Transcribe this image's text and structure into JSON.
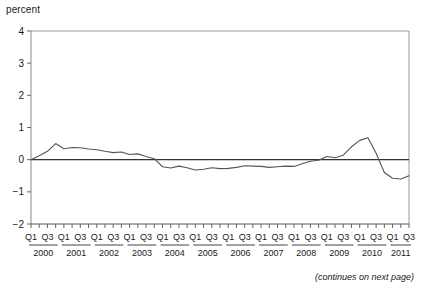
{
  "figure": {
    "caption": "(continues on next page)"
  },
  "chart_data": {
    "type": "line",
    "title": "",
    "subtitle": "",
    "xlabel": "",
    "ylabel": "percent",
    "ylim": [
      -2,
      4
    ],
    "yticks": [
      -2,
      -1,
      0,
      1,
      2,
      3,
      4
    ],
    "ytick_labels": [
      "−2",
      "−1",
      "0",
      "1",
      "2",
      "3",
      "4"
    ],
    "grid": false,
    "legend": "none",
    "zero_line": true,
    "quarter_labels": [
      "Q1",
      "Q3"
    ],
    "years": [
      "2000",
      "2001",
      "2002",
      "2003",
      "2004",
      "2005",
      "2006",
      "2007",
      "2008",
      "2009",
      "2010",
      "2011"
    ],
    "x": [
      "2000 Q1",
      "2000 Q2",
      "2000 Q3",
      "2000 Q4",
      "2001 Q1",
      "2001 Q2",
      "2001 Q3",
      "2001 Q4",
      "2002 Q1",
      "2002 Q2",
      "2002 Q3",
      "2002 Q4",
      "2003 Q1",
      "2003 Q2",
      "2003 Q3",
      "2003 Q4",
      "2004 Q1",
      "2004 Q2",
      "2004 Q3",
      "2004 Q4",
      "2005 Q1",
      "2005 Q2",
      "2005 Q3",
      "2005 Q4",
      "2006 Q1",
      "2006 Q2",
      "2006 Q3",
      "2006 Q4",
      "2007 Q1",
      "2007 Q2",
      "2007 Q3",
      "2007 Q4",
      "2008 Q1",
      "2008 Q2",
      "2008 Q3",
      "2008 Q4",
      "2009 Q1",
      "2009 Q2",
      "2009 Q3",
      "2009 Q4",
      "2010 Q1",
      "2010 Q2",
      "2010 Q3",
      "2010 Q4",
      "2011 Q1",
      "2011 Q2",
      "2011 Q3"
    ],
    "series": [
      {
        "name": "percent",
        "color": "#555555",
        "values": [
          0.0,
          0.12,
          0.26,
          0.5,
          0.34,
          0.38,
          0.37,
          0.33,
          0.31,
          0.26,
          0.22,
          0.24,
          0.16,
          0.18,
          0.1,
          0.03,
          -0.22,
          -0.26,
          -0.2,
          -0.25,
          -0.32,
          -0.3,
          -0.25,
          -0.28,
          -0.27,
          -0.24,
          -0.19,
          -0.2,
          -0.21,
          -0.24,
          -0.22,
          -0.2,
          -0.21,
          -0.13,
          -0.05,
          -0.02,
          0.1,
          0.06,
          0.14,
          0.4,
          0.6,
          0.68,
          0.2,
          -0.4,
          -0.58,
          -0.6,
          -0.5
        ]
      }
    ],
    "annotations": []
  }
}
